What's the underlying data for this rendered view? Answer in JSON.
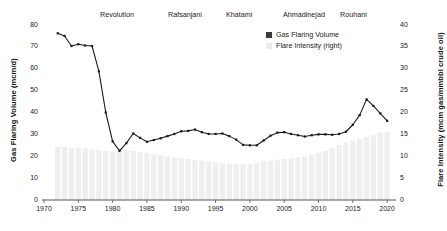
{
  "chart_data": {
    "type": "bar",
    "title": "",
    "subtitle": "",
    "xlabel": "",
    "ylabel": "Gas Flaring Volume (mcm/d)",
    "y2label": "Flare Intensity (mcm gas/mmbbl crude oil)",
    "xlim": [
      1970,
      2021
    ],
    "ylim": [
      0,
      80
    ],
    "y2lim": [
      0,
      40
    ],
    "grid": false,
    "legend_position": "top-right",
    "xticks": [
      1970,
      1975,
      1980,
      1985,
      1990,
      1995,
      2000,
      2005,
      2010,
      2015,
      2020
    ],
    "yticks": [
      0,
      10,
      20,
      30,
      40,
      50,
      60,
      70,
      80
    ],
    "y2ticks": [
      0,
      5,
      10,
      15,
      20,
      25,
      30,
      35,
      40
    ],
    "x": [
      1972,
      1973,
      1974,
      1975,
      1976,
      1977,
      1978,
      1979,
      1980,
      1981,
      1982,
      1983,
      1984,
      1985,
      1986,
      1987,
      1988,
      1989,
      1990,
      1991,
      1992,
      1993,
      1994,
      1995,
      1996,
      1997,
      1998,
      1999,
      2000,
      2001,
      2002,
      2003,
      2004,
      2005,
      2006,
      2007,
      2008,
      2009,
      2010,
      2011,
      2012,
      2013,
      2014,
      2015,
      2016,
      2017,
      2018,
      2019,
      2020
    ],
    "series": [
      {
        "name": "Gas Flaring Volume",
        "type": "line",
        "axis": "left",
        "color": "#1a1a1a",
        "marker": "square",
        "values": [
          76.2,
          75.0,
          70.4,
          71.2,
          70.6,
          70.4,
          58.8,
          40.0,
          26.8,
          22.5,
          26.0,
          30.4,
          28.4,
          26.6,
          27.4,
          28.2,
          29.2,
          30.2,
          31.4,
          31.6,
          32.2,
          31.0,
          30.2,
          30.2,
          30.4,
          29.2,
          27.6,
          25.2,
          25.0,
          25.0,
          27.2,
          29.4,
          30.8,
          31.0,
          30.2,
          29.6,
          29.0,
          29.6,
          30.0,
          30.0,
          29.8,
          30.2,
          31.2,
          34.4,
          38.8,
          46.0,
          43.0,
          39.6,
          36.2
        ]
      },
      {
        "name": "Flare Intensity (right)",
        "type": "bar",
        "axis": "right",
        "color": "#efefef",
        "values": [
          12.1,
          12.2,
          11.9,
          12.0,
          11.8,
          11.6,
          11.4,
          11.2,
          11.0,
          11.5,
          11.4,
          11.2,
          11.0,
          10.8,
          10.4,
          10.2,
          10.0,
          9.8,
          9.6,
          9.4,
          9.2,
          9.0,
          8.8,
          8.6,
          8.4,
          8.3,
          8.2,
          8.2,
          8.3,
          8.5,
          8.8,
          9.0,
          9.2,
          9.4,
          9.6,
          9.8,
          10.0,
          10.4,
          10.8,
          11.2,
          11.8,
          12.6,
          13.2,
          13.6,
          14.0,
          14.4,
          14.8,
          15.4,
          15.6
        ]
      }
    ],
    "annotations": [
      {
        "label": "Revolution",
        "x_px": 100
      },
      {
        "label": "Rafsanjani",
        "x_px": 168
      },
      {
        "label": "Khatami",
        "x_px": 226
      },
      {
        "label": "Ahmadinejad",
        "x_px": 283
      },
      {
        "label": "Rouhani",
        "x_px": 340
      }
    ]
  },
  "legend": {
    "items": [
      {
        "label": "Gas Flaring Volume",
        "color": "#3a3a3a"
      },
      {
        "label": "Flare Intensity (right)",
        "color": "#ececec"
      }
    ]
  }
}
